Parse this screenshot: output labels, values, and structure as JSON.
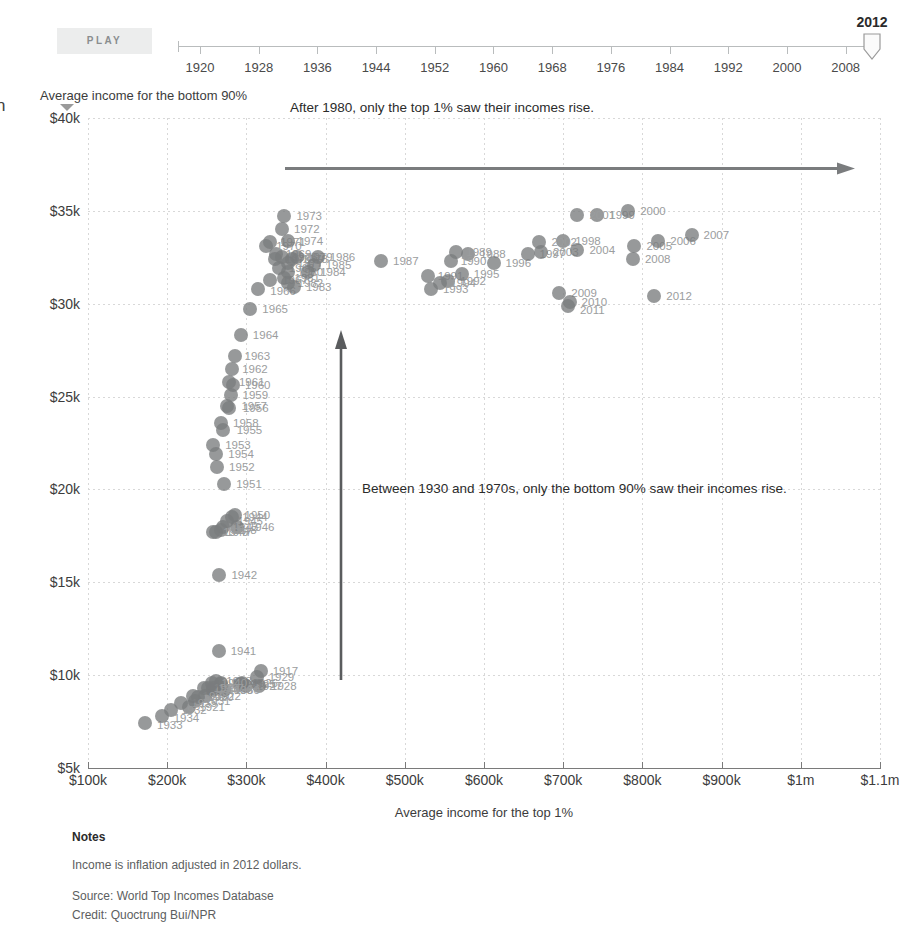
{
  "edge_glyph": "n",
  "player": {
    "play_label": "PLAY",
    "current_year": "2012",
    "tick_labels": [
      "1920",
      "1928",
      "1936",
      "1944",
      "1952",
      "1960",
      "1968",
      "1976",
      "1984",
      "1992",
      "2000",
      "2008"
    ],
    "tick_years": [
      1920,
      1928,
      1936,
      1944,
      1952,
      1960,
      1968,
      1976,
      1984,
      1992,
      2000,
      2008
    ],
    "range_start": 1917,
    "range_end": 2012
  },
  "annotations": {
    "top": "After 1980, only the top 1% saw their incomes rise.",
    "middle": "Between 1930 and 1970s, only the bottom 90% saw their incomes rise."
  },
  "notes": {
    "title": "Notes",
    "line1": "Income is inflation adjusted in 2012 dollars.",
    "source": "Source: World Top Incomes Database",
    "credit": "Credit: Quoctrung Bui/NPR"
  },
  "colors": {
    "dot": "#7a7c7e",
    "dot_label": "#9b9d9e",
    "grid": "#d8d8d8",
    "axis": "#7a7a7a",
    "text": "#2b2b2b",
    "play_bg": "#eceded",
    "play_text": "#8a8d8f"
  },
  "chart_data": {
    "type": "scatter",
    "title": "",
    "xlabel": "Average income for the top 1%",
    "ylabel": "Average income for the bottom 90%",
    "xlim": [
      100000,
      1100000
    ],
    "ylim": [
      5000,
      40000
    ],
    "xticks": [
      100000,
      200000,
      300000,
      400000,
      500000,
      600000,
      700000,
      800000,
      900000,
      1000000,
      1100000
    ],
    "xticklabels": [
      "$100k",
      "$200k",
      "$300k",
      "$400k",
      "$500k",
      "$600k",
      "$700k",
      "$800k",
      "$900k",
      "$1m",
      "$1.1m"
    ],
    "yticks": [
      5000,
      10000,
      15000,
      20000,
      25000,
      30000,
      35000,
      40000
    ],
    "yticklabels": [
      "$5k",
      "$10k",
      "$15k",
      "$20k",
      "$25k",
      "$30k",
      "$35k",
      "$40k"
    ],
    "grid": true,
    "legend": false,
    "point_label_key": "year",
    "points": [
      {
        "year": "1917",
        "x": 318000,
        "y": 10200,
        "label": "1917",
        "lx": 12,
        "ly": 0
      },
      {
        "year": "1918",
        "x": 258000,
        "y": 9300,
        "label": "1918",
        "lx": 10,
        "ly": 0
      },
      {
        "year": "1919",
        "x": 268000,
        "y": 9500,
        "label": "1919",
        "lx": 10,
        "ly": 0
      },
      {
        "year": "1920",
        "x": 239000,
        "y": 8800,
        "label": "1920",
        "lx": 10,
        "ly": 0
      },
      {
        "year": "1921",
        "x": 228000,
        "y": 8300,
        "label": "1921",
        "lx": 10,
        "ly": 0
      },
      {
        "year": "1922",
        "x": 248000,
        "y": 8900,
        "label": "1922",
        "lx": 10,
        "ly": 0
      },
      {
        "year": "1923",
        "x": 262000,
        "y": 9700,
        "label": "1923",
        "lx": 10,
        "ly": 0
      },
      {
        "year": "1924",
        "x": 268000,
        "y": 9600,
        "label": "1924",
        "lx": 10,
        "ly": 0
      },
      {
        "year": "1925",
        "x": 292000,
        "y": 9500,
        "label": "1925",
        "lx": 10,
        "ly": 0
      },
      {
        "year": "1926",
        "x": 295000,
        "y": 9600,
        "label": "1926",
        "lx": 10,
        "ly": 0
      },
      {
        "year": "1927",
        "x": 300000,
        "y": 9400,
        "label": "1927",
        "lx": 10,
        "ly": 0
      },
      {
        "year": "1928",
        "x": 316000,
        "y": 9400,
        "label": "1928",
        "lx": 12,
        "ly": 0
      },
      {
        "year": "1929",
        "x": 313000,
        "y": 9900,
        "label": "1929",
        "lx": 12,
        "ly": 0
      },
      {
        "year": "1930",
        "x": 272000,
        "y": 9200,
        "label": "1930",
        "lx": 10,
        "ly": 0
      },
      {
        "year": "1931",
        "x": 235000,
        "y": 8600,
        "label": "1931",
        "lx": 10,
        "ly": 0
      },
      {
        "year": "1932",
        "x": 205000,
        "y": 8100,
        "label": "1932",
        "lx": 10,
        "ly": 0
      },
      {
        "year": "1933",
        "x": 172000,
        "y": 7400,
        "label": "1933",
        "lx": 12,
        "ly": 2
      },
      {
        "year": "1934",
        "x": 193000,
        "y": 7800,
        "label": "1934",
        "lx": 12,
        "ly": 2
      },
      {
        "year": "1935",
        "x": 218000,
        "y": 8500,
        "label": "1935",
        "lx": 10,
        "ly": 0
      },
      {
        "year": "1936",
        "x": 258000,
        "y": 9200,
        "label": "1936",
        "lx": 14,
        "ly": 0
      },
      {
        "year": "1937",
        "x": 252000,
        "y": 9300,
        "label": "1937",
        "lx": 10,
        "ly": 0
      },
      {
        "year": "1938",
        "x": 232000,
        "y": 8900,
        "label": "1938",
        "lx": 10,
        "ly": 0
      },
      {
        "year": "1939",
        "x": 246000,
        "y": 9300,
        "label": "1939",
        "lx": 10,
        "ly": 0
      },
      {
        "year": "1940",
        "x": 256000,
        "y": 9600,
        "label": "1940",
        "lx": 10,
        "ly": 0
      },
      {
        "year": "1941",
        "x": 265000,
        "y": 11300,
        "label": "1941",
        "lx": 12,
        "ly": 0
      },
      {
        "year": "1942",
        "x": 266000,
        "y": 15400,
        "label": "1942",
        "lx": 12,
        "ly": 0
      },
      {
        "year": "1943",
        "x": 270000,
        "y": 18000,
        "label": "1943",
        "lx": 10,
        "ly": 0
      },
      {
        "year": "1944",
        "x": 282000,
        "y": 18500,
        "label": "1944",
        "lx": 10,
        "ly": 0
      },
      {
        "year": "1945",
        "x": 276000,
        "y": 18300,
        "label": "1945",
        "lx": 10,
        "ly": 0
      },
      {
        "year": "1946",
        "x": 288000,
        "y": 18000,
        "label": "1946",
        "lx": 12,
        "ly": 0
      },
      {
        "year": "1947",
        "x": 262000,
        "y": 17700,
        "label": "1947",
        "lx": 10,
        "ly": 0
      },
      {
        "year": "1948",
        "x": 268000,
        "y": 17800,
        "label": "1948",
        "lx": 10,
        "ly": 0
      },
      {
        "year": "1949",
        "x": 258000,
        "y": 17700,
        "label": "1949",
        "lx": 10,
        "ly": 0
      },
      {
        "year": "1950",
        "x": 285000,
        "y": 18600,
        "label": "1950",
        "lx": 10,
        "ly": 0
      },
      {
        "year": "1951",
        "x": 272000,
        "y": 20300,
        "label": "1951",
        "lx": 12,
        "ly": 0
      },
      {
        "year": "1952",
        "x": 263000,
        "y": 21200,
        "label": "1952",
        "lx": 12,
        "ly": 0
      },
      {
        "year": "1953",
        "x": 258000,
        "y": 22400,
        "label": "1953",
        "lx": 12,
        "ly": 0
      },
      {
        "year": "1954",
        "x": 262000,
        "y": 21900,
        "label": "1954",
        "lx": 12,
        "ly": 0
      },
      {
        "year": "1955",
        "x": 270000,
        "y": 23200,
        "label": "1955",
        "lx": 14,
        "ly": 0
      },
      {
        "year": "1956",
        "x": 278000,
        "y": 24400,
        "label": "1956",
        "lx": 14,
        "ly": 0
      },
      {
        "year": "1957",
        "x": 276000,
        "y": 24500,
        "label": "1957",
        "lx": 14,
        "ly": 0
      },
      {
        "year": "1958",
        "x": 268000,
        "y": 23600,
        "label": "1958",
        "lx": 12,
        "ly": 0
      },
      {
        "year": "1959",
        "x": 280000,
        "y": 25100,
        "label": "1959",
        "lx": 12,
        "ly": 0
      },
      {
        "year": "1960",
        "x": 283000,
        "y": 25600,
        "label": "1960",
        "lx": 12,
        "ly": 0
      },
      {
        "year": "1961",
        "x": 278000,
        "y": 25800,
        "label": "1961",
        "lx": 10,
        "ly": 0
      },
      {
        "year": "1962",
        "x": 282000,
        "y": 26500,
        "label": "1962",
        "lx": 10,
        "ly": 0
      },
      {
        "year": "1963",
        "x": 285000,
        "y": 27200,
        "label": "1963",
        "lx": 10,
        "ly": 0
      },
      {
        "year": "1964",
        "x": 293000,
        "y": 28300,
        "label": "1964",
        "lx": 12,
        "ly": 0
      },
      {
        "year": "1965",
        "x": 305000,
        "y": 29700,
        "label": "1965",
        "lx": 12,
        "ly": 0
      },
      {
        "year": "1966",
        "x": 315000,
        "y": 30800,
        "label": "1966",
        "lx": 12,
        "ly": 2
      },
      {
        "year": "1967",
        "x": 330000,
        "y": 31300,
        "label": "1967",
        "lx": 12,
        "ly": 0
      },
      {
        "year": "1968",
        "x": 341000,
        "y": 31900,
        "label": "1968",
        "lx": 10,
        "ly": 0
      },
      {
        "year": "1969",
        "x": 337000,
        "y": 32700,
        "label": "1969",
        "lx": 10,
        "ly": 0
      },
      {
        "year": "1970",
        "x": 325000,
        "y": 33100,
        "label": "1970",
        "lx": 10,
        "ly": 0
      },
      {
        "year": "1971",
        "x": 330000,
        "y": 33300,
        "label": "1971",
        "lx": 10,
        "ly": 0
      },
      {
        "year": "1972",
        "x": 345000,
        "y": 34000,
        "label": "1972",
        "lx": 12,
        "ly": 0
      },
      {
        "year": "1973",
        "x": 348000,
        "y": 34700,
        "label": "1973",
        "lx": 12,
        "ly": 0
      },
      {
        "year": "1974",
        "x": 352000,
        "y": 33400,
        "label": "1974",
        "lx": 10,
        "ly": 0
      },
      {
        "year": "1975",
        "x": 336000,
        "y": 32400,
        "label": "1975",
        "lx": 10,
        "ly": 0
      },
      {
        "year": "1976",
        "x": 345000,
        "y": 32500,
        "label": "1976",
        "lx": 10,
        "ly": 0
      },
      {
        "year": "1977",
        "x": 352000,
        "y": 32200,
        "label": "1977",
        "lx": 10,
        "ly": 0
      },
      {
        "year": "1978",
        "x": 358000,
        "y": 32400,
        "label": "1978",
        "lx": 10,
        "ly": 0
      },
      {
        "year": "1979",
        "x": 364000,
        "y": 32500,
        "label": "1979",
        "lx": 10,
        "ly": 0
      },
      {
        "year": "1980",
        "x": 352000,
        "y": 31700,
        "label": "1980",
        "lx": 10,
        "ly": 0
      },
      {
        "year": "1981",
        "x": 348000,
        "y": 31400,
        "label": "1981",
        "lx": 10,
        "ly": 0
      },
      {
        "year": "1982",
        "x": 352000,
        "y": 31100,
        "label": "1982",
        "lx": 10,
        "ly": 0
      },
      {
        "year": "1983",
        "x": 360000,
        "y": 30900,
        "label": "1983",
        "lx": 12,
        "ly": 0
      },
      {
        "year": "1984",
        "x": 378000,
        "y": 31700,
        "label": "1984",
        "lx": 12,
        "ly": 0
      },
      {
        "year": "1985",
        "x": 385000,
        "y": 32100,
        "label": "1985",
        "lx": 12,
        "ly": 0
      },
      {
        "year": "1986",
        "x": 390000,
        "y": 32500,
        "label": "1986",
        "lx": 12,
        "ly": 0
      },
      {
        "year": "1987",
        "x": 470000,
        "y": 32300,
        "label": "1987",
        "lx": 12,
        "ly": 0
      },
      {
        "year": "1988",
        "x": 580000,
        "y": 32700,
        "label": "1988",
        "lx": 12,
        "ly": 0
      },
      {
        "year": "1989",
        "x": 565000,
        "y": 32800,
        "label": "1989",
        "lx": 10,
        "ly": 0
      },
      {
        "year": "1990",
        "x": 558000,
        "y": 32300,
        "label": "1990",
        "lx": 10,
        "ly": 0
      },
      {
        "year": "1991",
        "x": 529000,
        "y": 31500,
        "label": "1991",
        "lx": 10,
        "ly": 0
      },
      {
        "year": "1992",
        "x": 555000,
        "y": 31200,
        "label": "1992",
        "lx": 12,
        "ly": 0
      },
      {
        "year": "1993",
        "x": 533000,
        "y": 30800,
        "label": "1993",
        "lx": 12,
        "ly": 0
      },
      {
        "year": "1994",
        "x": 545000,
        "y": 31100,
        "label": "1994",
        "lx": 10,
        "ly": 0
      },
      {
        "year": "1995",
        "x": 572000,
        "y": 31600,
        "label": "1995",
        "lx": 12,
        "ly": 0
      },
      {
        "year": "1996",
        "x": 612000,
        "y": 32200,
        "label": "1996",
        "lx": 12,
        "ly": 0
      },
      {
        "year": "1997",
        "x": 655000,
        "y": 32700,
        "label": "1997",
        "lx": 12,
        "ly": 0
      },
      {
        "year": "1998",
        "x": 700000,
        "y": 33400,
        "label": "1998",
        "lx": 12,
        "ly": 0
      },
      {
        "year": "1999",
        "x": 743000,
        "y": 34800,
        "label": "1999",
        "lx": 12,
        "ly": 0
      },
      {
        "year": "2000",
        "x": 782000,
        "y": 35000,
        "label": "2000",
        "lx": 12,
        "ly": 0
      },
      {
        "year": "2001",
        "x": 718000,
        "y": 34800,
        "label": "2001",
        "lx": 12,
        "ly": 0
      },
      {
        "year": "2002",
        "x": 670000,
        "y": 33300,
        "label": "2002",
        "lx": 12,
        "ly": 0
      },
      {
        "year": "2003",
        "x": 672000,
        "y": 32800,
        "label": "2003",
        "lx": 12,
        "ly": 0
      },
      {
        "year": "2004",
        "x": 718000,
        "y": 32900,
        "label": "2004",
        "lx": 12,
        "ly": 0
      },
      {
        "year": "2005",
        "x": 790000,
        "y": 33100,
        "label": "2005",
        "lx": 12,
        "ly": 0
      },
      {
        "year": "2006",
        "x": 820000,
        "y": 33400,
        "label": "2006",
        "lx": 12,
        "ly": 0
      },
      {
        "year": "2007",
        "x": 862000,
        "y": 33700,
        "label": "2007",
        "lx": 12,
        "ly": 0
      },
      {
        "year": "2008",
        "x": 788000,
        "y": 32400,
        "label": "2008",
        "lx": 12,
        "ly": 0
      },
      {
        "year": "2009",
        "x": 695000,
        "y": 30600,
        "label": "2009",
        "lx": 12,
        "ly": 0
      },
      {
        "year": "2010",
        "x": 708000,
        "y": 30100,
        "label": "2010",
        "lx": 12,
        "ly": 0
      },
      {
        "year": "2011",
        "x": 706000,
        "y": 29900,
        "label": "2011",
        "lx": 12,
        "ly": 4
      },
      {
        "year": "2012",
        "x": 815000,
        "y": 30400,
        "label": "2012",
        "lx": 12,
        "ly": 0
      }
    ]
  }
}
